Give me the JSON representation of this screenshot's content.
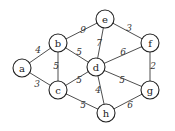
{
  "graph": {
    "nodes": [
      {
        "id": "a",
        "label": "a",
        "x": 22,
        "y": 68
      },
      {
        "id": "b",
        "label": "b",
        "x": 58,
        "y": 43
      },
      {
        "id": "c",
        "label": "c",
        "x": 58,
        "y": 90
      },
      {
        "id": "d",
        "label": "d",
        "x": 96,
        "y": 67
      },
      {
        "id": "e",
        "label": "e",
        "x": 105,
        "y": 19
      },
      {
        "id": "f",
        "label": "f",
        "x": 150,
        "y": 43
      },
      {
        "id": "g",
        "label": "g",
        "x": 150,
        "y": 90
      },
      {
        "id": "h",
        "label": "h",
        "x": 106,
        "y": 113
      }
    ],
    "edges": [
      {
        "from": "a",
        "to": "b",
        "weight": "4",
        "lx": 38,
        "ly": 50
      },
      {
        "from": "a",
        "to": "c",
        "weight": "3",
        "lx": 37,
        "ly": 84
      },
      {
        "from": "b",
        "to": "c",
        "weight": "5",
        "lx": 56,
        "ly": 66
      },
      {
        "from": "b",
        "to": "e",
        "weight": "9",
        "lx": 83,
        "ly": 30
      },
      {
        "from": "b",
        "to": "d",
        "weight": "5",
        "lx": 79,
        "ly": 52
      },
      {
        "from": "c",
        "to": "d",
        "weight": "5",
        "lx": 79,
        "ly": 80
      },
      {
        "from": "c",
        "to": "h",
        "weight": "5",
        "lx": 83,
        "ly": 105
      },
      {
        "from": "d",
        "to": "e",
        "weight": "7",
        "lx": 99,
        "ly": 43
      },
      {
        "from": "d",
        "to": "f",
        "weight": "6",
        "lx": 123,
        "ly": 52
      },
      {
        "from": "d",
        "to": "g",
        "weight": "5",
        "lx": 122,
        "ly": 80
      },
      {
        "from": "d",
        "to": "h",
        "weight": "4",
        "lx": 98,
        "ly": 90
      },
      {
        "from": "e",
        "to": "f",
        "weight": "3",
        "lx": 129,
        "ly": 28
      },
      {
        "from": "f",
        "to": "g",
        "weight": "2",
        "lx": 153,
        "ly": 66
      },
      {
        "from": "g",
        "to": "h",
        "weight": "6",
        "lx": 130,
        "ly": 105
      }
    ]
  }
}
